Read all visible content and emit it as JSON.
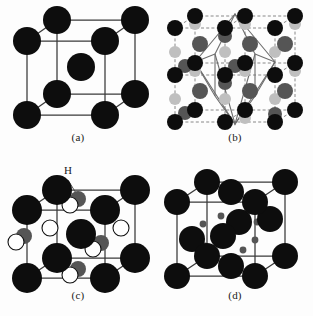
{
  "figure": {
    "background": "#ffffff",
    "layout": "2x2 grid of crystal structure unit-cell diagrams",
    "colors": {
      "metal_atom": "#0d0d0d",
      "interstitial_mid_gray": "#555555",
      "interstitial_light_gray": "#bfbfbf",
      "open_atom_fill": "#ffffff",
      "cell_edge": "#3a3a3a",
      "dashed_edge": "#7a7a7a",
      "polyhedron_edge": "#6e6e6e"
    },
    "panels": [
      {
        "id": "panel-a",
        "caption": "(a)",
        "structure": "body-centered cubic unit cell",
        "atom_counts": {
          "corner_dark": 8,
          "body_center_dark": 1
        },
        "labels": []
      },
      {
        "id": "panel-b",
        "caption": "(b)",
        "structure": "2x2 supercell array with dashed cell edges and a solid polyhedron outline",
        "atom_counts": {
          "corner_dark": 12,
          "mid_gray": 12,
          "light_gray": 13
        },
        "labels": []
      },
      {
        "id": "panel-c",
        "caption": "(c)",
        "structure": "body-centered cubic cell with hydrogen interstitial sites",
        "atom_counts": {
          "corner_dark": 8,
          "body_center_dark": 1,
          "open_circles": 6,
          "gray_circles": 5
        },
        "labels": [
          {
            "text": "H",
            "points_to": "interstitial hydrogen site"
          }
        ]
      },
      {
        "id": "panel-d",
        "caption": "(d)",
        "structure": "face-centered cubic cell with small interstitial dots",
        "atom_counts": {
          "corner_dark": 8,
          "face_center_dark": 6,
          "small_dots": 8
        },
        "labels": []
      }
    ]
  }
}
